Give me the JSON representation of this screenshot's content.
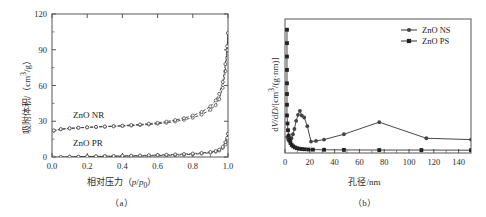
{
  "figure": {
    "panels": [
      {
        "caption": "（a）",
        "xlabel_html": "相对压力（<i>p</i>/<i>p</i><sub>0</sub>）",
        "ylabel_html": "吸附体积/（cm<sup>3</sup>/g）",
        "series_labels": [
          "ZnO NR",
          "ZnO PR"
        ]
      },
      {
        "caption": "（b）",
        "xlabel_html": "孔径/nm",
        "ylabel_html": "d<i>V</i>/d<i>D</i>/[cm<sup>3</sup>/(g·nm)]",
        "legend": [
          "ZnO NS",
          "ZnO PS"
        ]
      }
    ]
  },
  "chart_data": [
    {
      "type": "line",
      "panel": "a",
      "title": "",
      "xlabel": "相对压力（p/p0）",
      "ylabel": "吸附体积/（cm3/g）",
      "xlim": [
        0,
        1
      ],
      "ylim": [
        0,
        120
      ],
      "xticks": [
        0.0,
        0.2,
        0.4,
        0.6,
        0.8,
        1.0
      ],
      "xticklabels": [
        "0.0",
        "0.2",
        "0.4",
        "0.6",
        "0.8",
        "1.0"
      ],
      "yticks": [
        0,
        30,
        60,
        90,
        120
      ],
      "yticklabels": [
        "0",
        "30",
        "60",
        "90",
        "120"
      ],
      "grid": false,
      "legend_position": "in-plot-annotation",
      "series": [
        {
          "name": "ZnO NR adsorption",
          "marker": "open-circle",
          "x": [
            0.01,
            0.05,
            0.1,
            0.15,
            0.2,
            0.25,
            0.3,
            0.35,
            0.4,
            0.45,
            0.5,
            0.55,
            0.6,
            0.65,
            0.7,
            0.75,
            0.8,
            0.85,
            0.9,
            0.93,
            0.95,
            0.97,
            0.985,
            0.995,
            1.0
          ],
          "y": [
            22.0,
            23.2,
            23.9,
            24.4,
            24.8,
            25.1,
            25.4,
            25.7,
            26.0,
            26.4,
            26.8,
            27.3,
            27.9,
            28.7,
            29.8,
            31.2,
            33.0,
            35.6,
            39.5,
            43.5,
            48.5,
            58.0,
            72.0,
            90.0,
            104.0
          ]
        },
        {
          "name": "ZnO NR desorption",
          "marker": "open-circle",
          "x": [
            1.0,
            0.995,
            0.985,
            0.97,
            0.95,
            0.93,
            0.9,
            0.85,
            0.8,
            0.75,
            0.7,
            0.65,
            0.6,
            0.55,
            0.5,
            0.45,
            0.4,
            0.35,
            0.3,
            0.25,
            0.2,
            0.15,
            0.1,
            0.05,
            0.01
          ],
          "y": [
            104.0,
            93.0,
            78.0,
            63.0,
            53.0,
            47.5,
            42.5,
            37.8,
            34.8,
            32.6,
            31.0,
            29.7,
            28.7,
            27.9,
            27.3,
            26.8,
            26.3,
            25.9,
            25.6,
            25.3,
            25.0,
            24.6,
            24.1,
            23.4,
            22.4
          ]
        },
        {
          "name": "ZnO PR adsorption",
          "marker": "open-circle",
          "x": [
            0.01,
            0.05,
            0.1,
            0.15,
            0.2,
            0.25,
            0.3,
            0.35,
            0.4,
            0.45,
            0.5,
            0.55,
            0.6,
            0.65,
            0.7,
            0.75,
            0.8,
            0.85,
            0.9,
            0.93,
            0.95,
            0.97,
            0.985,
            0.995,
            1.0
          ],
          "y": [
            -0.6,
            -0.2,
            0.0,
            0.2,
            0.3,
            0.4,
            0.5,
            0.6,
            0.7,
            0.8,
            0.9,
            1.0,
            1.2,
            1.4,
            1.6,
            1.9,
            2.3,
            2.8,
            3.6,
            4.4,
            5.4,
            7.6,
            10.5,
            14.5,
            19.5
          ]
        },
        {
          "name": "ZnO PR desorption",
          "marker": "open-circle",
          "x": [
            1.0,
            0.995,
            0.985,
            0.97,
            0.95,
            0.93,
            0.9,
            0.85,
            0.8,
            0.75,
            0.7,
            0.65,
            0.6,
            0.55,
            0.5,
            0.45,
            0.4,
            0.35,
            0.3,
            0.25,
            0.2,
            0.15,
            0.1,
            0.05,
            0.01
          ],
          "y": [
            19.5,
            16.0,
            12.5,
            8.5,
            6.2,
            5.0,
            4.2,
            3.4,
            2.9,
            2.5,
            2.2,
            1.9,
            1.7,
            1.5,
            1.3,
            1.1,
            1.0,
            0.8,
            0.7,
            0.6,
            0.5,
            0.3,
            0.2,
            0.0,
            -0.5
          ]
        }
      ],
      "annotations": [
        {
          "text": "ZnO NR",
          "x": 0.12,
          "y": 33
        },
        {
          "text": "ZnO PR",
          "x": 0.12,
          "y": 9
        }
      ]
    },
    {
      "type": "line",
      "panel": "b",
      "title": "",
      "xlabel": "孔径/nm",
      "ylabel": "dV/dD/[cm3/(g·nm)]",
      "xlim": [
        0,
        150
      ],
      "ylim": [
        0,
        100
      ],
      "xticks": [
        0,
        20,
        40,
        60,
        80,
        100,
        120,
        140
      ],
      "xticklabels": [
        "0",
        "20",
        "40",
        "60",
        "80",
        "100",
        "120",
        "140"
      ],
      "yticks": [],
      "yticklabels": [],
      "grid": false,
      "legend_position": "top-right",
      "series": [
        {
          "name": "ZnO NS",
          "marker": "filled-circle",
          "x": [
            1.8,
            2.6,
            3.4,
            4.2,
            5.2,
            6.4,
            7.6,
            9.0,
            10.5,
            12.0,
            13.5,
            15.5,
            18.0,
            21.0,
            25.0,
            31.5,
            47.5,
            76.0,
            114.0,
            150.0
          ],
          "y": [
            12.0,
            10.0,
            9.0,
            9.5,
            11.0,
            14.0,
            18.0,
            24.0,
            28.5,
            31.5,
            28.0,
            26.5,
            20.0,
            8.5,
            9.0,
            10.0,
            14.0,
            23.0,
            11.0,
            10.0
          ]
        },
        {
          "name": "ZnO PS",
          "marker": "filled-square",
          "x": [
            1.6,
            1.6,
            1.6,
            1.6,
            1.6,
            1.6,
            1.6,
            1.6,
            2.0,
            2.4,
            3.0,
            3.6,
            4.4,
            5.4,
            6.6,
            8.0,
            9.6,
            11.5,
            13.5,
            16.0,
            19.0,
            22.5,
            31.5,
            47.5,
            76.0,
            110.0,
            150.0
          ],
          "y": [
            92.0,
            82.0,
            72.0,
            62.0,
            52.0,
            44.0,
            36.0,
            28.0,
            22.0,
            17.0,
            13.0,
            10.0,
            7.5,
            6.0,
            5.0,
            4.2,
            3.6,
            3.2,
            3.0,
            2.8,
            2.6,
            2.5,
            2.4,
            2.3,
            2.2,
            2.2,
            2.1
          ]
        }
      ]
    }
  ]
}
